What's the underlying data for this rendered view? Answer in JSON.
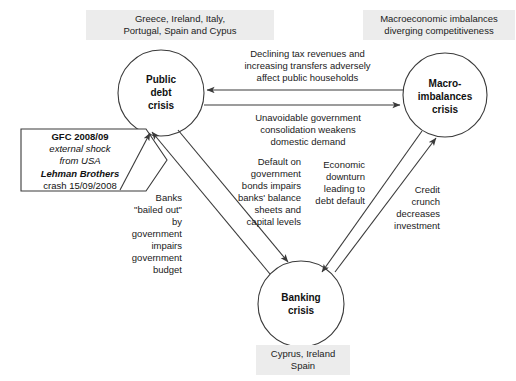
{
  "diagram": {
    "line_color": "#3a3a3a",
    "label_bg": "#ececec"
  },
  "nodes": [
    {
      "id": "public-debt",
      "label": "Public\ndebt\ncrisis"
    },
    {
      "id": "macro-imbalances",
      "label": "Macro-\nimbalances\ncrisis"
    },
    {
      "id": "banking",
      "label": "Banking\ncrisis"
    }
  ],
  "context_labels": [
    {
      "id": "public-debt-countries",
      "text": "Greece, Ireland, Italy,\nPortugal, Spain and Cypus"
    },
    {
      "id": "macro-imbalances-note",
      "text": "Macroeconomic imbalances\ndiverging competitiveness"
    },
    {
      "id": "banking-countries",
      "text": "Cyprus, Ireland\nSpain"
    }
  ],
  "shock_box": {
    "line1": "GFC 2008/09",
    "line2": "external shock",
    "line3": "from USA",
    "line4": "Lehman Brothers",
    "line5": "crash 15/09/2008"
  },
  "edge_labels": [
    {
      "id": "macro-to-public",
      "text": "Declining tax revenues and\nincreasing transfers adversely\naffect public households"
    },
    {
      "id": "public-to-macro",
      "text": "Unavoidable government\nconsolidation weakens\ndomestic demand"
    },
    {
      "id": "public-to-banking",
      "text": "Default on\ngovernment\nbonds impairs\nbanks' balance\nsheets and\ncapital levels"
    },
    {
      "id": "banking-to-public",
      "text": "Banks\n\"bailed out\"\nby\ngovernment\nimpairs\ngovernment\nbudget"
    },
    {
      "id": "macro-to-banking",
      "text": "Economic\ndownturn\nleading to\ndebt default"
    },
    {
      "id": "banking-to-macro",
      "text": "Credit\ncrunch\ndecreases\ninvestment"
    }
  ]
}
